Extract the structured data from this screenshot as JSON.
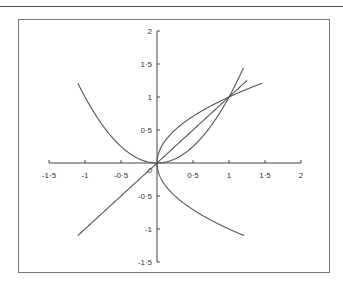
{
  "chart_data": {
    "type": "line",
    "title": "",
    "xlabel": "",
    "ylabel": "",
    "xlim": [
      -1.5,
      2
    ],
    "ylim": [
      -1.5,
      2
    ],
    "grid": false,
    "legend": null,
    "x_ticks": [
      "-1·5",
      "-1",
      "-0·5",
      "0",
      "0·5",
      "1",
      "1·5",
      "2"
    ],
    "x_tick_values": [
      -1.5,
      -1,
      -0.5,
      0,
      0.5,
      1,
      1.5,
      2
    ],
    "y_ticks": [
      "-1·5",
      "-1",
      "-0·5",
      "0·5",
      "1",
      "1·5",
      "2"
    ],
    "y_tick_values": [
      -1.5,
      -1,
      -0.5,
      0.5,
      1,
      1.5,
      2
    ],
    "origin_label": "0",
    "series": [
      {
        "name": "y = x^2",
        "x_range": [
          -1.1,
          1.2
        ]
      },
      {
        "name": "y = x",
        "x_range": [
          -1.1,
          1.25
        ]
      },
      {
        "name": "y = sqrt(x)",
        "x_range": [
          0,
          1.46
        ]
      },
      {
        "name": "y = -sqrt(x)",
        "x_range": [
          0,
          1.21
        ]
      }
    ],
    "annotations": [
      "curves intersect at (0,0) and (1,1)"
    ]
  }
}
